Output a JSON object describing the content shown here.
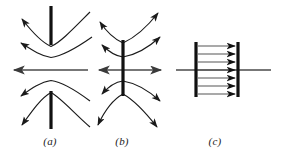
{
  "figure": {
    "background_color": "#ffffff",
    "stroke_color": "#1a1a1a",
    "axis_color": "#555555",
    "width": 281,
    "height": 164,
    "panels": [
      {
        "id": "a",
        "caption": "(a)",
        "caption_x": 50,
        "caption_y": 143,
        "description": "Field lines curving away from a pair of collinear vertical bars separated by a gap; horizontal axis arrow points left",
        "bars": [
          {
            "name": "upper-bar",
            "x": 51,
            "y1": 6,
            "y2": 45,
            "width": 3
          },
          {
            "name": "lower-bar",
            "x": 51,
            "y1": 91,
            "y2": 129,
            "width": 3
          }
        ],
        "axis": {
          "x1": 12,
          "x2": 88,
          "y": 70,
          "arrow_at": "left"
        },
        "curves": [
          {
            "name": "curve-a-outer-top",
            "d": "M 88 12 C 72 28, 60 42, 51 46 C 42 42, 33 32, 20 18",
            "arrows": [
              "end"
            ]
          },
          {
            "name": "curve-a-inner-top",
            "d": "M 90 36 C 74 48, 62 56, 51 57 C 42 56, 33 50, 18 42",
            "arrows": [
              "end"
            ]
          },
          {
            "name": "curve-a-inner-bottom",
            "d": "M 88 100 C 74 89, 62 82, 51 81 C 42 82, 33 88, 18 97",
            "arrows": [
              "end"
            ]
          },
          {
            "name": "curve-a-outer-bottom",
            "d": "M 88 128 C 72 114, 60 98, 51 93 C 42 98, 33 110, 20 126",
            "arrows": [
              "end"
            ]
          }
        ]
      },
      {
        "id": "b",
        "caption": "(b)",
        "caption_x": 122,
        "caption_y": 143,
        "description": "Field lines crossing a single continuous vertical bar; horizontal axis is a double-headed arrow",
        "bars": [
          {
            "name": "center-bar",
            "x": 123,
            "y1": 40,
            "y2": 96,
            "width": 3
          }
        ],
        "axis": {
          "x1": 96,
          "x2": 163,
          "y": 70,
          "arrow_at": "both"
        },
        "curves": [
          {
            "name": "curve-b-outer-top",
            "d": "M 160 12 C 148 26, 134 38, 123 43 C 112 38, 104 30, 99 22",
            "arrows": [
              "start",
              "end"
            ]
          },
          {
            "name": "curve-b-inner-top",
            "d": "M 160 36 C 148 48, 134 55, 123 57 C 114 56, 107 50, 101 44",
            "arrows": [
              "start",
              "end"
            ]
          },
          {
            "name": "curve-b-inner-bottom",
            "d": "M 160 100 C 148 90, 134 83, 123 82 C 114 83, 107 89, 101 95",
            "arrows": [
              "start",
              "end"
            ]
          },
          {
            "name": "curve-b-outer-bottom",
            "d": "M 158 128 C 146 114, 134 100, 123 94 C 112 100, 104 112, 97 126",
            "arrows": [
              "start",
              "end"
            ]
          }
        ]
      },
      {
        "id": "c",
        "caption": "(c)",
        "caption_x": 215,
        "caption_y": 143,
        "description": "Uniform field of seven parallel horizontal arrows between two vertical plates; horizontal axis line passes through",
        "bars": [
          {
            "name": "left-plate",
            "x": 196,
            "y1": 42,
            "y2": 97,
            "width": 3
          },
          {
            "name": "right-plate",
            "x": 238,
            "y1": 42,
            "y2": 97,
            "width": 3
          }
        ],
        "axis": {
          "x1": 176,
          "x2": 271,
          "y": 70,
          "arrow_at": "none"
        },
        "field_arrows": {
          "count": 7,
          "x_start": 198,
          "x_end": 237,
          "y_values": [
            46,
            54,
            62,
            70,
            78,
            86,
            94
          ],
          "direction": "right"
        }
      }
    ]
  }
}
